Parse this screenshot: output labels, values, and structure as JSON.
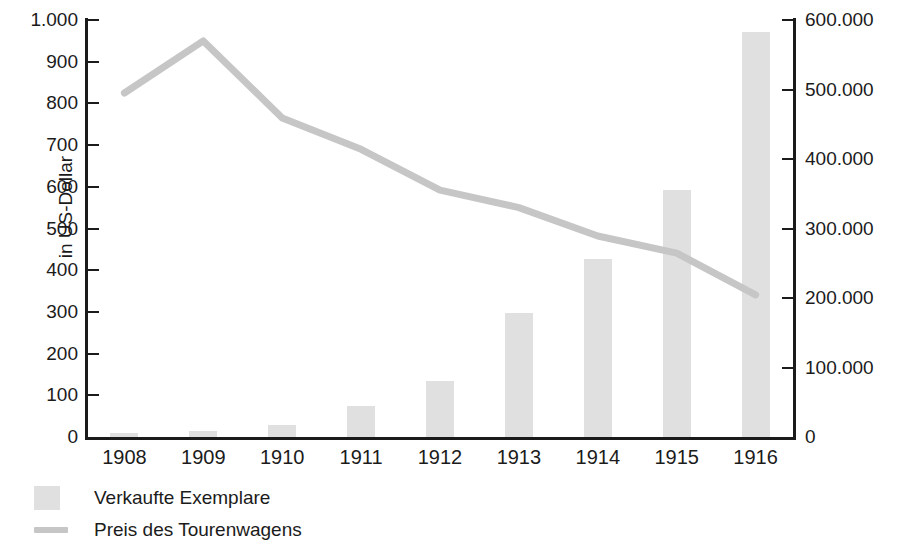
{
  "chart_data": {
    "type": "bar",
    "title": "",
    "subtitle": "",
    "xlabel": "",
    "ylabel": "in US-Dollar",
    "ylabel_right": "",
    "categories": [
      "1908",
      "1909",
      "1910",
      "1911",
      "1912",
      "1913",
      "1914",
      "1915",
      "1916"
    ],
    "ylim": [
      0,
      1000
    ],
    "ylim_right": [
      0,
      600000
    ],
    "y_ticks": [
      "0",
      "100",
      "200",
      "300",
      "400",
      "500",
      "600",
      "700",
      "800",
      "900",
      "1.000"
    ],
    "y_ticks_right": [
      "0",
      "100.000",
      "200.000",
      "300.000",
      "400.000",
      "500.000",
      "600.000"
    ],
    "grid": false,
    "legend_position": "bottom-left",
    "series": [
      {
        "name": "Verkaufte Exemplare",
        "type": "bar",
        "axis": "right",
        "color": "#e0e0e0",
        "values": [
          6000,
          8000,
          18000,
          45000,
          81000,
          178000,
          256000,
          355000,
          583000
        ]
      },
      {
        "name": "Preis des Tourenwagens",
        "type": "line",
        "axis": "left",
        "color": "#c6c6c6",
        "values": [
          825,
          950,
          765,
          690,
          592,
          550,
          482,
          441,
          341
        ]
      }
    ]
  },
  "legend": {
    "items": [
      {
        "label": "Verkaufte Exemplare",
        "swatch": "bar"
      },
      {
        "label": "Preis des Tourenwagens",
        "swatch": "line"
      }
    ]
  }
}
